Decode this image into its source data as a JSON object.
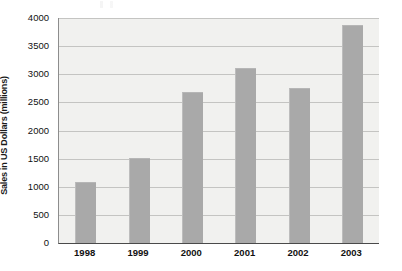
{
  "chart_data": {
    "type": "bar",
    "title": "",
    "xlabel": "",
    "ylabel": "Sales in US Dollars (millions)",
    "categories": [
      "1998",
      "1999",
      "2000",
      "2001",
      "2002",
      "2003"
    ],
    "values": [
      1080,
      1520,
      2680,
      3120,
      2750,
      3880
    ],
    "series": [
      {
        "name": "Sales",
        "values": [
          1080,
          1520,
          2680,
          3120,
          2750,
          3880
        ]
      }
    ],
    "ylim": [
      0,
      4000
    ],
    "yticks": [
      0,
      500,
      1000,
      1500,
      2000,
      2500,
      3000,
      3500,
      4000
    ],
    "ytick_labels": [
      "0",
      "500",
      "1000",
      "1500",
      "2000",
      "2500",
      "3000",
      "3500",
      "4000"
    ],
    "grid": true,
    "legend": false,
    "legend_position": "none",
    "colors": {
      "bar_fill": "#a9a9a9",
      "plot_background": "#f1f1ef",
      "gridline": "#c4c4c2",
      "axis_line": "#4a4a4a",
      "text": "#111111",
      "page_background": "#ffffff"
    }
  }
}
